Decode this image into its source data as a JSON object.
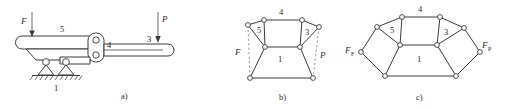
{
  "figure": {
    "background": "#ffffff",
    "ink": "#3a3a3a",
    "panels": [
      {
        "id": "a",
        "caption": "a)",
        "type": "mechanism-schematic",
        "labels": {
          "link5": "5",
          "link4": "4",
          "link3": "3",
          "ground1": "1",
          "force_input": "F",
          "force_output": "P"
        }
      },
      {
        "id": "b",
        "caption": "b)",
        "type": "kinematic-graph",
        "labels": {
          "link5": "5",
          "link4": "4",
          "link3": "3",
          "link1": "1",
          "force_input": "F",
          "force_output": "P"
        }
      },
      {
        "id": "c",
        "caption": "c)",
        "type": "reciprocal-force-diagram",
        "labels": {
          "link5": "5",
          "link4": "4",
          "link3": "3",
          "link1": "1",
          "force_input": "F",
          "force_input_sub": "F",
          "force_output": "F",
          "force_output_sub": "P"
        }
      }
    ]
  }
}
